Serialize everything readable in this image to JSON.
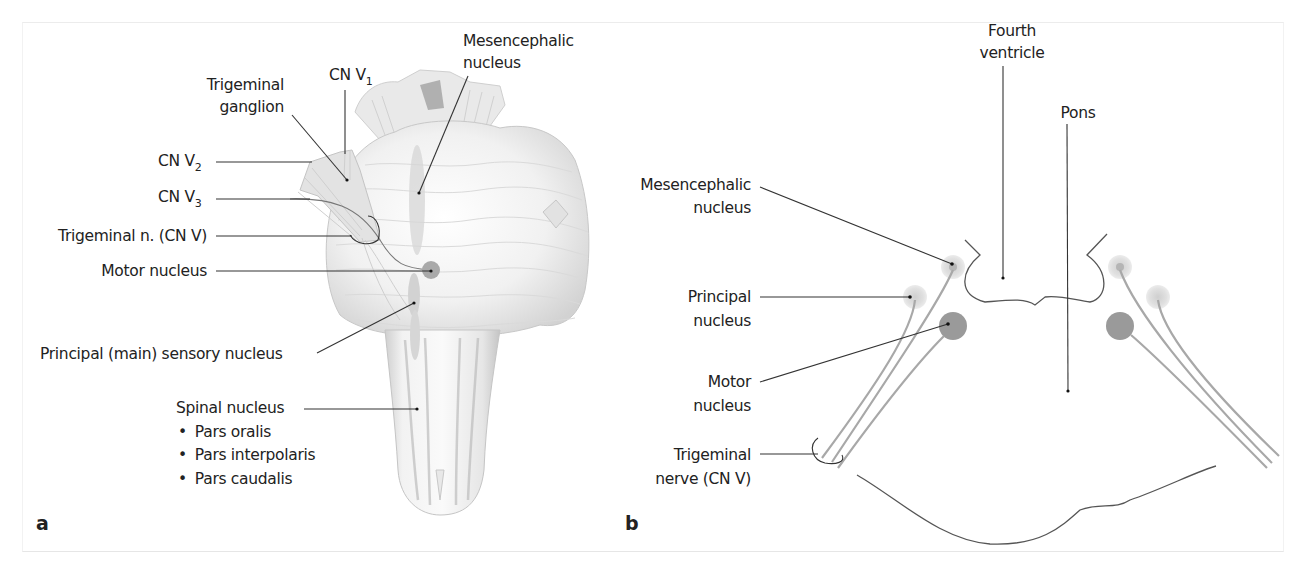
{
  "figure": {
    "panel_a": {
      "letter": "a",
      "labels": {
        "cn_v1": {
          "main": "CN V",
          "sub": "1"
        },
        "trigeminal_ganglion": [
          "Trigeminal",
          "ganglion"
        ],
        "cn_v2": {
          "main": "CN V",
          "sub": "2"
        },
        "cn_v3": {
          "main": "CN V",
          "sub": "3"
        },
        "trigeminal_n": "Trigeminal n. (CN V)",
        "motor_nucleus": "Motor nucleus",
        "mesencephalic_nucleus": [
          "Mesencephalic",
          "nucleus"
        ],
        "principal_sensory_nucleus": "Principal (main) sensory nucleus",
        "spinal_nucleus": "Spinal nucleus",
        "spinal_parts": [
          "Pars oralis",
          "Pars interpolaris",
          "Pars caudalis"
        ]
      }
    },
    "panel_b": {
      "letter": "b",
      "labels": {
        "fourth_ventricle": [
          "Fourth",
          "ventricle"
        ],
        "pons": "Pons",
        "mesencephalic_nucleus": [
          "Mesencephalic",
          "nucleus"
        ],
        "principal_nucleus": [
          "Principal",
          "nucleus"
        ],
        "motor_nucleus": [
          "Motor",
          "nucleus"
        ],
        "trigeminal_nerve": [
          "Trigeminal",
          "nerve (CN V)"
        ]
      }
    },
    "bullet": "•",
    "colors": {
      "text": "#222222",
      "leader_line": "#333333",
      "motor_nucleus": "#9a9a9a",
      "sensory_nucleus": "#d9d9d9",
      "nerve_fiber": "#a8a8a8",
      "outline": "#555555"
    }
  }
}
